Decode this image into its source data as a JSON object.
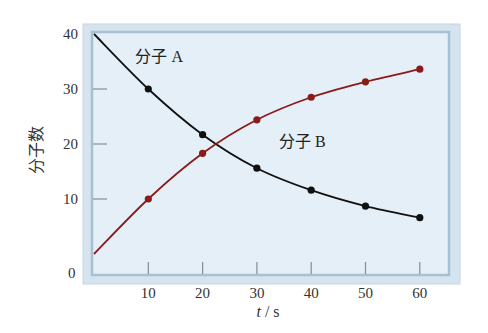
{
  "chart_data": {
    "type": "line",
    "title": "",
    "xlabel": "t / s",
    "xlabel_var": "t",
    "xlabel_unit": " / s",
    "ylabel": "分子数",
    "x": [
      0,
      10,
      20,
      30,
      40,
      50,
      60
    ],
    "xlim": [
      0,
      65
    ],
    "ylim": [
      0,
      42
    ],
    "x_ticks": [
      10,
      20,
      30,
      40,
      50,
      60
    ],
    "x_tick_labels": [
      "10",
      "20",
      "30",
      "40",
      "50",
      "60"
    ],
    "y_ticks": [
      10,
      20,
      30,
      40
    ],
    "y_tick_labels": [
      "10",
      "20",
      "30",
      "40"
    ],
    "origin_label": "0",
    "grid": false,
    "legend": "inline labels",
    "series": [
      {
        "name": "分子 A",
        "color": "#111111",
        "values": [
          40,
          30,
          21.7,
          15.6,
          11.6,
          8.7,
          6.6
        ]
      },
      {
        "name": "分子 B",
        "color": "#8b1a1a",
        "values": [
          0,
          10,
          18.3,
          24.4,
          28.5,
          31.3,
          33.6
        ]
      }
    ],
    "annotations": [
      {
        "text": "分子 A",
        "x": 8,
        "y": 36
      },
      {
        "text": "分子 B",
        "x": 35,
        "y": 20.5
      }
    ]
  },
  "colors": {
    "plot_background": "#e2eef7",
    "frame_outer": "#c9d9e6",
    "frame_inner": "#9fb8cc",
    "series_a": "#111111",
    "series_b": "#8b1a1a"
  }
}
